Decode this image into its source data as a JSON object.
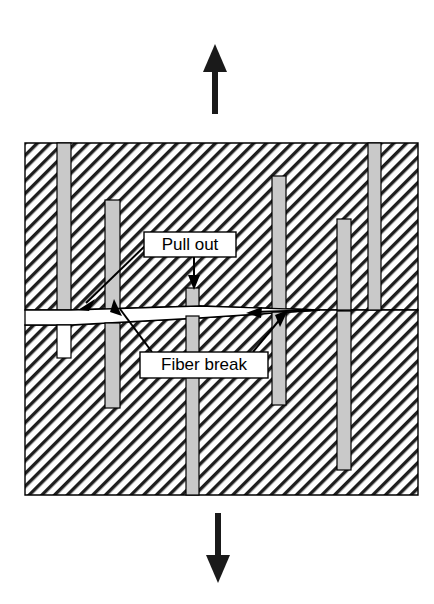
{
  "figure": {
    "matrix": {
      "name": "matrix-block",
      "fill_pattern": "diagonal-hatch",
      "hatch_color": "#1a1a1a",
      "background_color": "#ffffff",
      "outline_color": "#000000",
      "bounds": {
        "x": 25,
        "y": 143,
        "width": 393,
        "height": 352
      }
    },
    "fiber": {
      "fill_color": "#c9c9c9",
      "outline_color": "#000000"
    },
    "void": {
      "fill_color": "#ffffff",
      "outline_color": "#000000"
    },
    "crack": {
      "name": "matrix-crack",
      "fill_color": "#ffffff",
      "outline_color": "#000000",
      "description": "horizontal crack opening that tapers to the right"
    },
    "load_arrows": [
      {
        "name": "tensile-load-arrow-up",
        "direction": "up",
        "color": "#1a1a1a"
      },
      {
        "name": "tensile-load-arrow-down",
        "direction": "down",
        "color": "#1a1a1a"
      }
    ],
    "labels": [
      {
        "id": "pull-out",
        "text": "Pull out",
        "box": {
          "x": 144,
          "y": 232,
          "width": 92,
          "height": 25
        },
        "box_fill": "#ffffff",
        "box_stroke": "#000000",
        "leader_count": 2
      },
      {
        "id": "fiber-break",
        "text": "Fiber break",
        "box": {
          "x": 140,
          "y": 352,
          "width": 128,
          "height": 26
        },
        "box_fill": "#ffffff",
        "box_stroke": "#000000",
        "leader_count": 2
      }
    ],
    "fibers": [
      {
        "name": "fiber-1",
        "x": 57,
        "y": 143,
        "width": 14,
        "height": 167,
        "state": "intact-upper"
      },
      {
        "name": "fiber-1-pullout-void",
        "x": 57,
        "y": 325,
        "width": 14,
        "height": 33,
        "state": "pull-out-void"
      },
      {
        "name": "fiber-2",
        "x": 105,
        "y": 200,
        "width": 15,
        "height": 110,
        "state": "intact-upper"
      },
      {
        "name": "fiber-2-lower",
        "x": 105,
        "y": 325,
        "width": 15,
        "height": 83,
        "state": "intact-lower"
      },
      {
        "name": "fiber-3-upper",
        "x": 186,
        "y": 290,
        "width": 13,
        "height": 20,
        "state": "broken-upper"
      },
      {
        "name": "fiber-3-lower",
        "x": 186,
        "y": 318,
        "width": 13,
        "height": 177,
        "state": "broken-lower"
      },
      {
        "name": "fiber-4",
        "x": 272,
        "y": 176,
        "width": 14,
        "height": 134,
        "state": "intact-upper"
      },
      {
        "name": "fiber-4-lower",
        "x": 272,
        "y": 322,
        "width": 14,
        "height": 83,
        "state": "intact-lower"
      },
      {
        "name": "fiber-5",
        "x": 337,
        "y": 219,
        "width": 14,
        "height": 91,
        "state": "intact-upper"
      },
      {
        "name": "fiber-5-lower",
        "x": 337,
        "y": 317,
        "width": 14,
        "height": 153,
        "state": "intact-lower"
      },
      {
        "name": "fiber-6",
        "x": 368,
        "y": 143,
        "width": 13,
        "height": 167,
        "state": "intact-upper"
      }
    ]
  }
}
